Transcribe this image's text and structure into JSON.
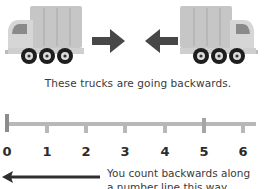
{
  "illustration": {
    "left_truck": {
      "direction": "facing-left-moving-right",
      "arrow": "right-arrow"
    },
    "right_truck": {
      "direction": "facing-right-moving-left",
      "arrow": "left-arrow"
    },
    "caption": "These trucks are going backwards."
  },
  "number_line": {
    "labels": [
      "0",
      "1",
      "2",
      "3",
      "4",
      "5",
      "6"
    ],
    "highlighted": [
      "0",
      "5"
    ],
    "colors": {
      "line": "#b8b8b8",
      "major_tick": "#8c8c8c"
    }
  },
  "note": {
    "line1": "You count backwards along",
    "line2": "a number line this way.",
    "arrow": "left-arrow"
  },
  "colors": {
    "truck_body": "#c4c4c4",
    "truck_cab": "#d8d8d8",
    "arrow": "#4a4a4a",
    "wheel": "#222222"
  }
}
